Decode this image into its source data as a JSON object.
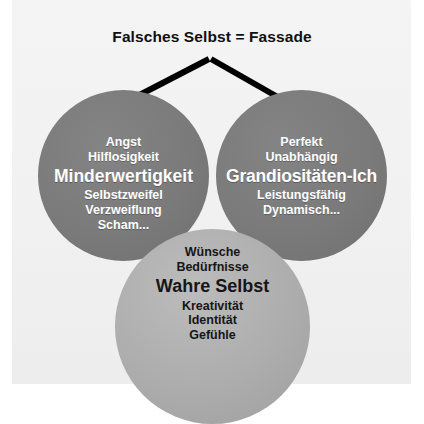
{
  "figure": {
    "title": "Falsches Selbst = Fassade",
    "background_color": "#f2f2f2",
    "page_background": "#ffffff"
  },
  "arrows": {
    "color": "#000000",
    "count": 2,
    "left_arrow_name": "arrow-to-minderwertigkeit",
    "right_arrow_name": "arrow-to-grandiositaeten-ich"
  },
  "circles": {
    "left": {
      "name": "minderwertigkeit-circle",
      "fill_color": "#7a7a7a",
      "text_color": "#ffffff",
      "headline": "Minderwertigkeit",
      "items_above": [
        "Angst",
        "Hilflosigkeit"
      ],
      "items_below": [
        "Selbstzweifel",
        "Verzweiflung",
        "Scham..."
      ]
    },
    "right": {
      "name": "grandiositaeten-ich-circle",
      "fill_color": "#7a7a7a",
      "text_color": "#ffffff",
      "headline": "Grandiositäten-Ich",
      "items_above": [
        "Perfekt",
        "Unabhängig"
      ],
      "items_below": [
        "Leistungsfähig",
        "Dynamisch..."
      ]
    },
    "bottom": {
      "name": "wahre-selbst-circle",
      "fill_color": "#adadad",
      "text_color": "#161616",
      "headline": "Wahre Selbst",
      "items_above": [
        "Wünsche",
        "Bedürfnisse"
      ],
      "items_below": [
        "Kreativität",
        "Identität",
        "Gefühle"
      ]
    }
  }
}
